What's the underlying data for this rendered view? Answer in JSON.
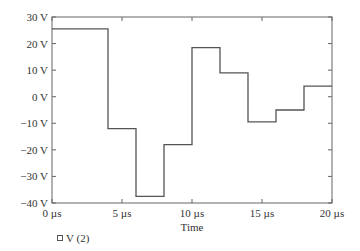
{
  "chart_data": {
    "type": "line",
    "title": "",
    "xlabel": "Time",
    "ylabel": "",
    "xlim": [
      0,
      20
    ],
    "ylim": [
      -40,
      30
    ],
    "x_unit": "µs",
    "y_unit": "V",
    "grid": false,
    "xticks": [
      0,
      5,
      10,
      15,
      20
    ],
    "xtick_labels": [
      "0 µs",
      "5 µs",
      "10 µs",
      "15 µs",
      "20 µs"
    ],
    "yticks": [
      30,
      20,
      10,
      0,
      -10,
      -20,
      -30,
      -40
    ],
    "ytick_labels": [
      "30 V",
      "20 V",
      "10 V",
      "0 V",
      "−10 V",
      "−20 V",
      "−30 V",
      "−40 V"
    ],
    "legend_position": "bottom-left",
    "series": [
      {
        "name": "V (2)",
        "style": "step",
        "color": "#555555",
        "steps": [
          {
            "x0": 0,
            "x1": 4,
            "y": 25.5
          },
          {
            "x0": 4,
            "x1": 6,
            "y": -12
          },
          {
            "x0": 6,
            "x1": 8,
            "y": -37.5
          },
          {
            "x0": 8,
            "x1": 10,
            "y": -18
          },
          {
            "x0": 10,
            "x1": 12,
            "y": 18.5
          },
          {
            "x0": 12,
            "x1": 14,
            "y": 9
          },
          {
            "x0": 14,
            "x1": 16,
            "y": -9.5
          },
          {
            "x0": 16,
            "x1": 18,
            "y": -5
          },
          {
            "x0": 18,
            "x1": 20,
            "y": 4
          }
        ]
      }
    ]
  }
}
